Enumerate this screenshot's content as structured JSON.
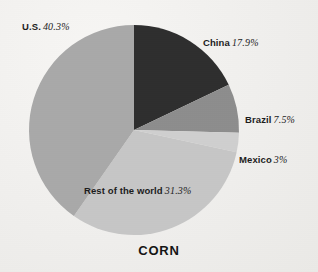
{
  "chart_data": {
    "type": "pie",
    "title": "CORN",
    "xlabel": "",
    "ylabel": "",
    "legend_position": "callout-labels",
    "grid": false,
    "start_angle_deg": 0,
    "direction": "clockwise",
    "categories": [
      "China",
      "Brazil",
      "Mexico",
      "Rest of the world",
      "U.S."
    ],
    "values": [
      17.9,
      7.5,
      3,
      31.3,
      40.3
    ],
    "value_labels": [
      "17.9%",
      "7.5%",
      "3%",
      "31.3%",
      "40.3%"
    ],
    "colors": [
      "#2e2e2e",
      "#8d8d8d",
      "#cfcfcf",
      "#c6c6c6",
      "#a9a9a9"
    ],
    "slices": [
      {
        "label": "China",
        "value": 17.9,
        "value_label": "17.9%",
        "color": "#2e2e2e"
      },
      {
        "label": "Brazil",
        "value": 7.5,
        "value_label": "7.5%",
        "color": "#8d8d8d"
      },
      {
        "label": "Mexico",
        "value": 3,
        "value_label": "3%",
        "color": "#cfcfcf"
      },
      {
        "label": "Rest of the world",
        "value": 31.3,
        "value_label": "31.3%",
        "color": "#c6c6c6"
      },
      {
        "label": "U.S.",
        "value": 40.3,
        "value_label": "40.3%",
        "color": "#a9a9a9"
      }
    ]
  },
  "labels": {
    "us": {
      "name": "U.S.",
      "value": "40.3%"
    },
    "china": {
      "name": "China",
      "value": "17.9%"
    },
    "brazil": {
      "name": "Brazil",
      "value": "7.5%"
    },
    "mexico": {
      "name": "Mexico",
      "value": "3%"
    },
    "row": {
      "name": "Rest of the world",
      "value": "31.3%"
    }
  },
  "title": "CORN",
  "background_color": "#f3f2f0"
}
